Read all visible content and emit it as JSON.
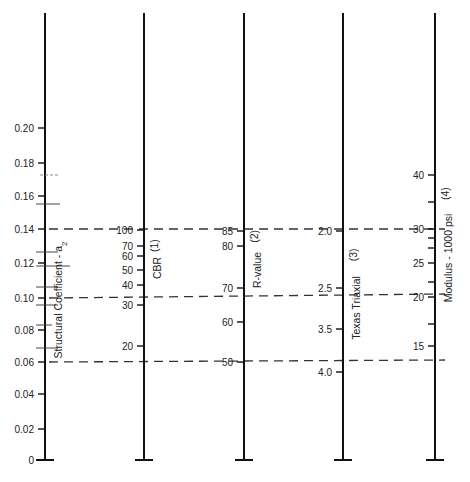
{
  "chart_data": {
    "type": "nomograph",
    "title": "",
    "grid": false,
    "axes": [
      {
        "id": "a2",
        "title": "Structural Coefficient - a",
        "title_sub": "2",
        "x": 45,
        "ticks": [
          {
            "label": "0.20",
            "y": 128
          },
          {
            "label": "0.18",
            "y": 163
          },
          {
            "label": "0.16",
            "y": 196
          },
          {
            "label": "0.14",
            "y": 229
          },
          {
            "label": "0.12",
            "y": 263
          },
          {
            "label": "0.10",
            "y": 298
          },
          {
            "label": "0.08",
            "y": 330
          },
          {
            "label": "0.06",
            "y": 362
          },
          {
            "label": "0.04",
            "y": 394
          },
          {
            "label": "0.02",
            "y": 429
          },
          {
            "label": "0",
            "y": 460
          }
        ],
        "minor_marks": [
          {
            "y": 175,
            "x1": 40,
            "x2": 58,
            "dashed": true
          },
          {
            "y": 204,
            "x1": 36,
            "x2": 60
          },
          {
            "y": 252,
            "x1": 36,
            "x2": 58
          },
          {
            "y": 266,
            "x1": 36,
            "x2": 70
          },
          {
            "y": 287,
            "x1": 36,
            "x2": 58
          },
          {
            "y": 305,
            "x1": 36,
            "x2": 58
          },
          {
            "y": 325,
            "x1": 36,
            "x2": 52
          },
          {
            "y": 348,
            "x1": 36,
            "x2": 58
          }
        ]
      },
      {
        "id": "cbr",
        "title": "CBR",
        "note": "(1)",
        "x": 144,
        "ticks": [
          {
            "label": "100",
            "y": 230
          },
          {
            "label": "70",
            "y": 246
          },
          {
            "label": "60",
            "y": 256
          },
          {
            "label": "50",
            "y": 270
          },
          {
            "label": "40",
            "y": 285
          },
          {
            "label": "30",
            "y": 305
          },
          {
            "label": "20",
            "y": 346
          }
        ]
      },
      {
        "id": "rvalue",
        "title": "R-value",
        "note": "(2)",
        "x": 244,
        "ticks": [
          {
            "label": "85",
            "y": 231
          },
          {
            "label": "80",
            "y": 246
          },
          {
            "label": "70",
            "y": 288
          },
          {
            "label": "60",
            "y": 322
          },
          {
            "label": "50",
            "y": 362
          }
        ]
      },
      {
        "id": "texas",
        "title": "Texas Triaxial",
        "note": "(3)",
        "x": 343,
        "ticks": [
          {
            "label": "2.0",
            "y": 231
          },
          {
            "label": "2.5",
            "y": 288
          },
          {
            "label": "3.5",
            "y": 329
          },
          {
            "label": "4.0",
            "y": 372
          }
        ]
      },
      {
        "id": "modulus",
        "title": "Modulus - 1000 psi",
        "note": "(4)",
        "x": 435,
        "ticks": [
          {
            "label": "40",
            "y": 175
          },
          {
            "label": "",
            "y": 202
          },
          {
            "label": "30",
            "y": 229
          },
          {
            "label": "",
            "y": 238
          },
          {
            "label": "",
            "y": 248
          },
          {
            "label": "25",
            "y": 263
          },
          {
            "label": "",
            "y": 282
          },
          {
            "label": "20",
            "y": 297
          },
          {
            "label": "",
            "y": 324
          },
          {
            "label": "15",
            "y": 346
          }
        ]
      }
    ],
    "reference_lines": [
      {
        "label": "a2 = 0.14 ↔ CBR 100 ↔ R 85 ↔ Texas 2.0 ↔ E 30",
        "y_left": 229,
        "y_right": 229
      },
      {
        "label": "a2 = 0.10 ↔ CBR ~32 ↔ R ~68 ↔ Texas ~2.6 ↔ E ~20.5",
        "y_left": 298,
        "y_right": 294
      },
      {
        "label": "a2 = 0.06 ↔ CBR ~17 ↔ R 50 ↔ Texas ~3.8 ↔ E ~13",
        "y_left": 362,
        "y_right": 360
      }
    ],
    "axis_top_y": 13,
    "axis_bottom_y": 460
  }
}
